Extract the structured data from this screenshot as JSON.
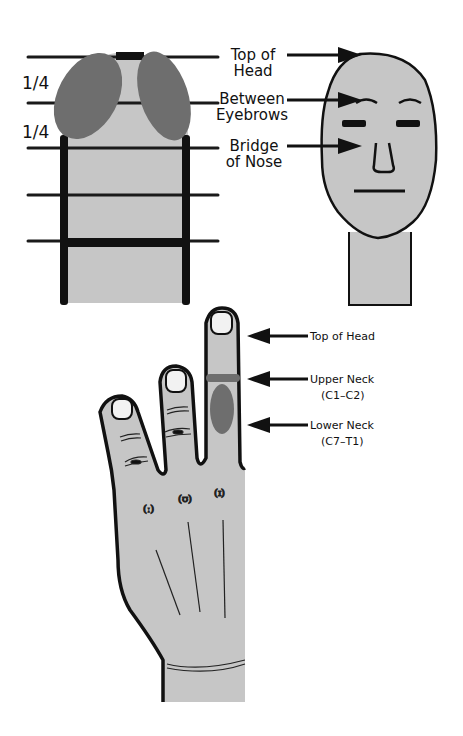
{
  "colors": {
    "skin": "#c6c6c6",
    "shade": "#6e6e6e",
    "outline": "#111111",
    "nail": "#f2f2f2"
  },
  "panel_top_left": {
    "fractions": [
      "1/4",
      "1/4"
    ],
    "horizontal_lines": 5
  },
  "panel_top_right": {
    "labels": [
      {
        "line1": "Top of",
        "line2": "Head"
      },
      {
        "line1": "Between",
        "line2": "Eyebrows"
      },
      {
        "line1": "Bridge",
        "line2": "of Nose"
      }
    ]
  },
  "panel_hand": {
    "labels": [
      {
        "line1": "Top of Head",
        "line2": ""
      },
      {
        "line1": "Upper Neck",
        "line2": "(C1–C2)"
      },
      {
        "line1": "Lower Neck",
        "line2": "(C7–T1)"
      }
    ]
  }
}
